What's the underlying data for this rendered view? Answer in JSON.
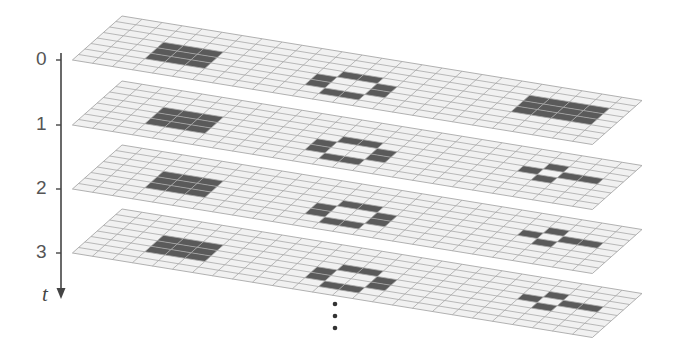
{
  "axis": {
    "label": "t",
    "ticks": [
      {
        "label": "0",
        "y": 60
      },
      {
        "label": "1",
        "y": 125
      },
      {
        "label": "2",
        "y": 189
      },
      {
        "label": "3",
        "y": 253
      }
    ],
    "continuation": "⋮"
  },
  "grid": {
    "cols": 26,
    "rows": 8,
    "origin_dx": 122,
    "col_vec": [
      20,
      3.25
    ],
    "row_vec": [
      -6.2,
      5.5
    ],
    "cell_fill": "#f1f1f1",
    "line_color": "#a8a8a8",
    "live_fill": "#5a5a5a"
  },
  "layers": [
    {
      "t": 0,
      "origin_y": 16,
      "live_cells": [
        [
          3,
          3
        ],
        [
          4,
          3
        ],
        [
          5,
          3
        ],
        [
          3,
          4
        ],
        [
          4,
          4
        ],
        [
          5,
          4
        ],
        [
          3,
          5
        ],
        [
          4,
          5
        ],
        [
          5,
          5
        ],
        [
          12,
          3
        ],
        [
          13,
          3
        ],
        [
          11,
          4
        ],
        [
          14,
          4
        ],
        [
          11,
          5
        ],
        [
          14,
          5
        ],
        [
          12,
          6
        ],
        [
          13,
          6
        ],
        [
          21,
          2
        ],
        [
          22,
          2
        ],
        [
          23,
          2
        ],
        [
          24,
          2
        ],
        [
          21,
          3
        ],
        [
          22,
          3
        ],
        [
          23,
          3
        ],
        [
          24,
          3
        ],
        [
          21,
          4
        ],
        [
          22,
          4
        ],
        [
          23,
          4
        ],
        [
          24,
          4
        ]
      ]
    },
    {
      "t": 1,
      "origin_y": 81,
      "live_cells": [
        [
          3,
          3
        ],
        [
          4,
          3
        ],
        [
          5,
          3
        ],
        [
          3,
          4
        ],
        [
          4,
          4
        ],
        [
          5,
          4
        ],
        [
          3,
          5
        ],
        [
          4,
          5
        ],
        [
          5,
          5
        ],
        [
          12,
          3
        ],
        [
          13,
          3
        ],
        [
          11,
          4
        ],
        [
          14,
          4
        ],
        [
          11,
          5
        ],
        [
          14,
          5
        ],
        [
          12,
          6
        ],
        [
          13,
          6
        ],
        [
          22,
          2
        ],
        [
          21,
          3
        ],
        [
          23,
          3
        ],
        [
          24,
          3
        ],
        [
          22,
          4
        ]
      ]
    },
    {
      "t": 2,
      "origin_y": 145,
      "live_cells": [
        [
          3,
          3
        ],
        [
          4,
          3
        ],
        [
          5,
          3
        ],
        [
          3,
          4
        ],
        [
          4,
          4
        ],
        [
          5,
          4
        ],
        [
          3,
          5
        ],
        [
          4,
          5
        ],
        [
          5,
          5
        ],
        [
          12,
          3
        ],
        [
          13,
          3
        ],
        [
          11,
          4
        ],
        [
          14,
          4
        ],
        [
          11,
          5
        ],
        [
          14,
          5
        ],
        [
          12,
          6
        ],
        [
          13,
          6
        ],
        [
          22,
          2
        ],
        [
          21,
          3
        ],
        [
          23,
          3
        ],
        [
          24,
          3
        ],
        [
          22,
          4
        ]
      ]
    },
    {
      "t": 3,
      "origin_y": 209,
      "live_cells": [
        [
          3,
          3
        ],
        [
          4,
          3
        ],
        [
          5,
          3
        ],
        [
          3,
          4
        ],
        [
          4,
          4
        ],
        [
          5,
          4
        ],
        [
          3,
          5
        ],
        [
          4,
          5
        ],
        [
          5,
          5
        ],
        [
          12,
          3
        ],
        [
          13,
          3
        ],
        [
          11,
          4
        ],
        [
          14,
          4
        ],
        [
          11,
          5
        ],
        [
          14,
          5
        ],
        [
          12,
          6
        ],
        [
          13,
          6
        ],
        [
          22,
          2
        ],
        [
          21,
          3
        ],
        [
          23,
          3
        ],
        [
          24,
          3
        ],
        [
          22,
          4
        ]
      ]
    }
  ]
}
